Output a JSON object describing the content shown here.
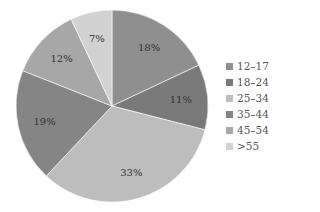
{
  "chart_data": {
    "type": "pie",
    "title": "",
    "categories": [
      "12–17",
      "18–24",
      "25–34",
      "35–44",
      "45–54",
      ">55"
    ],
    "values": [
      18,
      11,
      33,
      19,
      12,
      7
    ],
    "labels": [
      "18%",
      "11%",
      "33%",
      "19%",
      "12%",
      "7%"
    ],
    "colors": [
      "#8f8f8f",
      "#7a7a7a",
      "#bdbdbd",
      "#858585",
      "#a7a7a7",
      "#d2d2d2"
    ],
    "start_angle": "12 o'clock",
    "direction": "clockwise",
    "legend_position": "right"
  },
  "legend": {
    "items": [
      {
        "label": "12–17",
        "color": "#8f8f8f"
      },
      {
        "label": "18–24",
        "color": "#7a7a7a"
      },
      {
        "label": "25–34",
        "color": "#bdbdbd"
      },
      {
        "label": "35–44",
        "color": "#858585"
      },
      {
        "label": "45–54",
        "color": "#a7a7a7"
      },
      {
        "label": ">55",
        "color": "#d2d2d2"
      }
    ]
  }
}
